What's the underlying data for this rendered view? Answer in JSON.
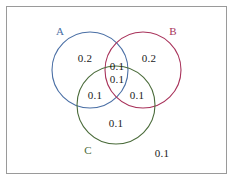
{
  "figure": {
    "title": "",
    "width": 234,
    "height": 182,
    "background": "#ffffff",
    "border_color": "#9a9a9a"
  },
  "chart_data": {
    "type": "venn",
    "title": "",
    "xlabel": "",
    "ylabel": "",
    "grid": false,
    "legend": "none",
    "sets": [
      {
        "key": "A",
        "label": "A",
        "color": "#4a6fa5",
        "cx": 90,
        "cy": 70,
        "r": 38
      },
      {
        "key": "B",
        "label": "B",
        "color": "#a8325a",
        "cx": 143,
        "cy": 70,
        "r": 38
      },
      {
        "key": "C",
        "label": "C",
        "color": "#4a6b3a",
        "cx": 116,
        "cy": 105,
        "r": 39
      }
    ],
    "set_label_positions": [
      {
        "key": "A",
        "x": 60,
        "y": 31
      },
      {
        "key": "B",
        "x": 173,
        "y": 31
      },
      {
        "key": "C",
        "x": 88,
        "y": 150
      }
    ],
    "regions": [
      {
        "key": "A_only",
        "label": "A only",
        "value": "0.2",
        "x": 85,
        "y": 58
      },
      {
        "key": "B_only",
        "label": "B only",
        "value": "0.2",
        "x": 149,
        "y": 58
      },
      {
        "key": "AB",
        "label": "A and B",
        "value": "0.1",
        "x": 117,
        "y": 66
      },
      {
        "key": "ABC",
        "label": "A and B and C",
        "value": "0.1",
        "x": 117,
        "y": 79
      },
      {
        "key": "AC",
        "label": "A and C",
        "value": "0.1",
        "x": 95,
        "y": 95
      },
      {
        "key": "BC",
        "label": "B and C",
        "value": "0.1",
        "x": 137,
        "y": 95
      },
      {
        "key": "C_only",
        "label": "C only",
        "value": "0.1",
        "x": 116,
        "y": 123
      },
      {
        "key": "outside",
        "label": "Outside",
        "value": "0.1",
        "x": 162,
        "y": 153
      }
    ],
    "total": "1.0"
  }
}
